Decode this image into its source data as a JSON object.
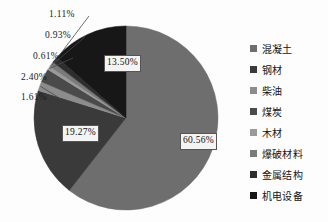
{
  "chart_data": {
    "type": "pie",
    "title": "",
    "legend_position": "right",
    "grid": false,
    "units": "%",
    "start_angle_deg": 0,
    "direction": "clockwise",
    "categories": [
      "混凝土",
      "钢材",
      "柴油",
      "煤炭",
      "木材",
      "爆破材料",
      "金属结构",
      "机电设备"
    ],
    "values": [
      60.56,
      19.27,
      1.61,
      2.4,
      0.61,
      0.93,
      1.11,
      13.5
    ],
    "value_labels": [
      "60.56%",
      "19.27%",
      "1.61%",
      "2.40%",
      "0.61%",
      "0.93%",
      "1.11%",
      "13.50%"
    ],
    "colors": [
      "#6e6e6e",
      "#3a3a3a",
      "#8c8c8c",
      "#4a4a4a",
      "#9a9a9a",
      "#7a7a7a",
      "#2e2e2e",
      "#171717"
    ],
    "slices": [
      {
        "label": "混凝土",
        "value": 60.56,
        "value_label": "60.56%",
        "color": "#6e6e6e",
        "label_placement": "inside"
      },
      {
        "label": "钢材",
        "value": 19.27,
        "value_label": "19.27%",
        "color": "#3a3a3a",
        "label_placement": "inside"
      },
      {
        "label": "柴油",
        "value": 1.61,
        "value_label": "1.61%",
        "color": "#8c8c8c",
        "label_placement": "callout"
      },
      {
        "label": "煤炭",
        "value": 2.4,
        "value_label": "2.40%",
        "color": "#4a4a4a",
        "label_placement": "callout"
      },
      {
        "label": "木材",
        "value": 0.61,
        "value_label": "0.61%",
        "color": "#9a9a9a",
        "label_placement": "callout"
      },
      {
        "label": "爆破材料",
        "value": 0.93,
        "value_label": "0.93%",
        "color": "#7a7a7a",
        "label_placement": "callout"
      },
      {
        "label": "金属结构",
        "value": 1.11,
        "value_label": "1.11%",
        "color": "#2e2e2e",
        "label_placement": "callout"
      },
      {
        "label": "机电设备",
        "value": 13.5,
        "value_label": "13.50%",
        "color": "#171717",
        "label_placement": "inside"
      }
    ]
  },
  "legend": {
    "items": [
      {
        "label": "混凝土",
        "color": "#6e6e6e"
      },
      {
        "label": "钢材",
        "color": "#3a3a3a"
      },
      {
        "label": "柴油",
        "color": "#8c8c8c"
      },
      {
        "label": "煤炭",
        "color": "#4a4a4a"
      },
      {
        "label": "木材",
        "color": "#9a9a9a"
      },
      {
        "label": "爆破材料",
        "color": "#7a7a7a"
      },
      {
        "label": "金属结构",
        "color": "#2e2e2e"
      },
      {
        "label": "机电设备",
        "color": "#171717"
      }
    ]
  },
  "callouts": [
    {
      "text": "1.11%",
      "left": 49,
      "top": 9
    },
    {
      "text": "0.93%",
      "left": 45,
      "top": 30
    },
    {
      "text": "0.61%",
      "left": 33,
      "top": 51
    },
    {
      "text": "2.40%",
      "left": 21,
      "top": 72
    },
    {
      "text": "1.61%",
      "left": 21,
      "top": 92
    }
  ],
  "inside_labels": [
    {
      "text": "13.50%",
      "left": 104,
      "top": 55
    },
    {
      "text": "19.27%",
      "left": 62,
      "top": 125
    },
    {
      "text": "60.56%",
      "left": 180,
      "top": 133
    }
  ]
}
